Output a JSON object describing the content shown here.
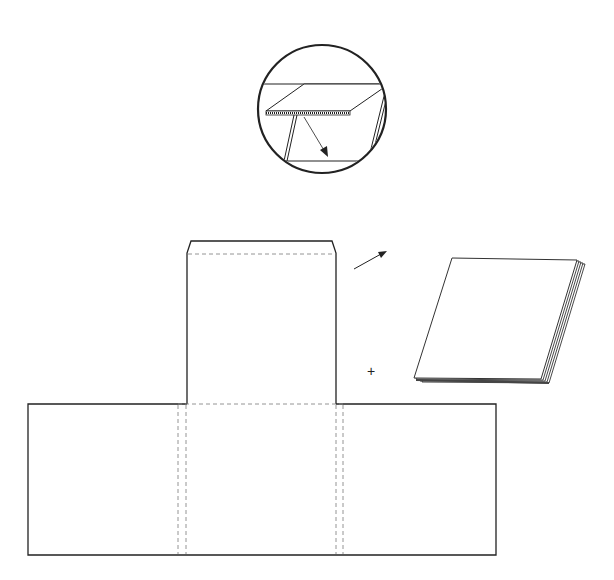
{
  "diagram": {
    "title": "",
    "colors": {
      "line": "#222222",
      "fold_line": "#888888",
      "background": "#ffffff"
    },
    "inset": {
      "label": "detail-magnifier",
      "shape": "circle",
      "center": [
        322,
        109
      ],
      "radius": 64
    },
    "template": {
      "flap": {
        "x": 187,
        "y": 241,
        "w": 149,
        "h": 163,
        "fold_y": 254
      },
      "base": {
        "x": 28,
        "y": 404,
        "w": 468,
        "h": 151
      },
      "fold_columns": [
        178,
        186,
        336,
        343
      ]
    },
    "stack": {
      "label": "paper-stack",
      "sheets": 5
    },
    "annotations": {
      "plus_sign": "+",
      "arrow": "direction-arrow"
    }
  }
}
